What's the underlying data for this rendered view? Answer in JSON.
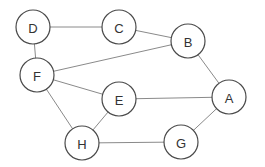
{
  "diagram": {
    "type": "undirected-graph",
    "nodes": [
      {
        "id": "D",
        "label": "D",
        "x": 33,
        "y": 27
      },
      {
        "id": "C",
        "label": "C",
        "x": 119,
        "y": 27
      },
      {
        "id": "B",
        "label": "B",
        "x": 188,
        "y": 41
      },
      {
        "id": "F",
        "label": "F",
        "x": 37,
        "y": 75
      },
      {
        "id": "E",
        "label": "E",
        "x": 119,
        "y": 99
      },
      {
        "id": "A",
        "label": "A",
        "x": 229,
        "y": 97
      },
      {
        "id": "H",
        "label": "H",
        "x": 82,
        "y": 143
      },
      {
        "id": "G",
        "label": "G",
        "x": 181,
        "y": 142
      }
    ],
    "edges": [
      {
        "from": "D",
        "to": "C"
      },
      {
        "from": "C",
        "to": "B"
      },
      {
        "from": "D",
        "to": "F"
      },
      {
        "from": "F",
        "to": "B"
      },
      {
        "from": "B",
        "to": "A"
      },
      {
        "from": "F",
        "to": "E"
      },
      {
        "from": "E",
        "to": "A"
      },
      {
        "from": "F",
        "to": "H"
      },
      {
        "from": "E",
        "to": "H"
      },
      {
        "from": "H",
        "to": "G"
      },
      {
        "from": "G",
        "to": "A"
      }
    ],
    "node_radius": 17,
    "colors": {
      "edge": "#8a8a8a",
      "node_stroke": "#4a4a4a",
      "node_fill": "#ffffff",
      "label": "#333333"
    }
  }
}
